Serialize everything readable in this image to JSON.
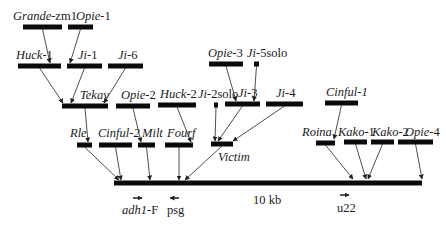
{
  "figure": {
    "type": "nested retrotransposon insertion map",
    "scale_label": "10 kb",
    "backbone": {
      "name": "main-locus",
      "x1": 114,
      "x2": 422,
      "y": 183
    }
  },
  "elements": [
    {
      "id": "grande-zm1",
      "name_italic": "Grande",
      "name_rest": "-zm1",
      "x1": 23,
      "x2": 62,
      "y": 27,
      "lx": 13,
      "ly": 20,
      "target": [
        50,
        63
      ]
    },
    {
      "id": "opie-1",
      "name_italic": "Opie",
      "name_rest": "-1",
      "x1": 68,
      "x2": 93,
      "y": 27,
      "lx": 76,
      "ly": 20,
      "target": [
        70,
        63
      ]
    },
    {
      "id": "huck-1",
      "name_italic": "Huck",
      "name_rest": "-1",
      "x1": 18,
      "x2": 61,
      "y": 66,
      "lx": 16,
      "ly": 59,
      "target": [
        63,
        103
      ]
    },
    {
      "id": "ji-1",
      "name_italic": "Ji",
      "name_rest": "-1",
      "x1": 67,
      "x2": 102,
      "y": 66,
      "lx": 78,
      "ly": 59,
      "target": [
        71,
        103
      ]
    },
    {
      "id": "ji-6",
      "name_italic": "Ji",
      "name_rest": "-6",
      "x1": 108,
      "x2": 143,
      "y": 66,
      "lx": 118,
      "ly": 59,
      "target": [
        104,
        103
      ]
    },
    {
      "id": "opie-3",
      "name_italic": "Opie",
      "name_rest": "-3",
      "x1": 209,
      "x2": 243,
      "y": 64,
      "lx": 208,
      "ly": 57,
      "target": [
        236,
        101
      ]
    },
    {
      "id": "ji-5solo",
      "name_italic": "Ji",
      "name_rest": "-5solo",
      "x1": 254,
      "x2": 259,
      "y": 64,
      "lx": 247,
      "ly": 57,
      "target": [
        254,
        101
      ]
    },
    {
      "id": "tekay",
      "name_italic": "Tekay",
      "name_rest": "",
      "x1": 62,
      "x2": 108,
      "y": 106,
      "lx": 80,
      "ly": 99,
      "target": [
        88,
        142
      ]
    },
    {
      "id": "opie-2",
      "name_italic": "Opie",
      "name_rest": "-2",
      "x1": 116,
      "x2": 150,
      "y": 106,
      "lx": 121,
      "ly": 99,
      "target": [
        141,
        142
      ]
    },
    {
      "id": "huck-2",
      "name_italic": "Huck",
      "name_rest": "-2",
      "x1": 158,
      "x2": 196,
      "y": 105,
      "lx": 160,
      "ly": 98,
      "target": [
        191,
        142
      ]
    },
    {
      "id": "ji-2solo",
      "name_italic": "Ji",
      "name_rest": "-2solo",
      "x1": 214,
      "x2": 218,
      "y": 105,
      "lx": 198,
      "ly": 98,
      "target": [
        215,
        141
      ]
    },
    {
      "id": "ji-3",
      "name_italic": "Ji",
      "name_rest": "-3",
      "x1": 225,
      "x2": 260,
      "y": 104,
      "lx": 238,
      "ly": 97,
      "target": [
        218,
        141
      ]
    },
    {
      "id": "ji-4",
      "name_italic": "Ji",
      "name_rest": "-4",
      "x1": 266,
      "x2": 303,
      "y": 104,
      "lx": 276,
      "ly": 97,
      "target": [
        233,
        141
      ]
    },
    {
      "id": "cinful-1",
      "name_italic": "Cinful-1",
      "name_rest": "",
      "x1": 325,
      "x2": 358,
      "y": 103,
      "lx": 326,
      "ly": 96,
      "target": [
        334,
        139
      ]
    },
    {
      "id": "rle",
      "name_italic": "Rle",
      "name_rest": "",
      "x1": 77,
      "x2": 92,
      "y": 145,
      "lx": 70,
      "ly": 137,
      "target": [
        119,
        180
      ]
    },
    {
      "id": "cinful-2",
      "name_italic": "Cinful-2",
      "name_rest": "",
      "x1": 99,
      "x2": 132,
      "y": 145,
      "lx": 98,
      "ly": 137,
      "target": [
        121,
        180
      ]
    },
    {
      "id": "milt",
      "name_italic": "Milt",
      "name_rest": "",
      "x1": 138,
      "x2": 155,
      "y": 145,
      "lx": 142,
      "ly": 137,
      "target": [
        150,
        180
      ]
    },
    {
      "id": "fourf",
      "name_italic": "Fourf",
      "name_rest": "",
      "x1": 165,
      "x2": 193,
      "y": 145,
      "lx": 167,
      "ly": 137,
      "target": [
        179,
        180
      ]
    },
    {
      "id": "victim",
      "name_italic": "Victim",
      "name_rest": "",
      "x1": 211,
      "x2": 233,
      "y": 144,
      "lx": 218,
      "ly": 161,
      "target": [
        185,
        180
      ]
    },
    {
      "id": "roina",
      "name_italic": "Roina",
      "name_rest": "",
      "x1": 316,
      "x2": 335,
      "y": 143,
      "lx": 302,
      "ly": 136,
      "target": [
        353,
        179
      ]
    },
    {
      "id": "kako-1",
      "name_italic": "Kako",
      "name_rest": "-1",
      "x1": 344,
      "x2": 367,
      "y": 142,
      "lx": 338,
      "ly": 136,
      "target": [
        366,
        179
      ]
    },
    {
      "id": "kako-2",
      "name_italic": "Kako",
      "name_rest": "-2",
      "x1": 371,
      "x2": 394,
      "y": 142,
      "lx": 372,
      "ly": 136,
      "target": [
        368,
        179
      ]
    },
    {
      "id": "opie-4",
      "name_italic": "Opie",
      "name_rest": "-4",
      "x1": 398,
      "x2": 433,
      "y": 142,
      "lx": 405,
      "ly": 136,
      "target": [
        422,
        179
      ]
    }
  ],
  "primers": [
    {
      "id": "adh1-f",
      "name_italic": "adh1",
      "name_rest": "-F",
      "direction": "right",
      "ax": 133,
      "ay": 198,
      "lx": 122,
      "ly": 214
    },
    {
      "id": "psg",
      "name_italic": "",
      "name_rest": "psg",
      "direction": "left",
      "ax": 170,
      "ay": 198,
      "lx": 167,
      "ly": 214
    },
    {
      "id": "u22",
      "name_italic": "",
      "name_rest": "u22",
      "direction": "right",
      "ax": 340,
      "ay": 195,
      "lx": 337,
      "ly": 212
    }
  ],
  "scale": {
    "label": "10 kb",
    "x": 253,
    "y": 204
  }
}
